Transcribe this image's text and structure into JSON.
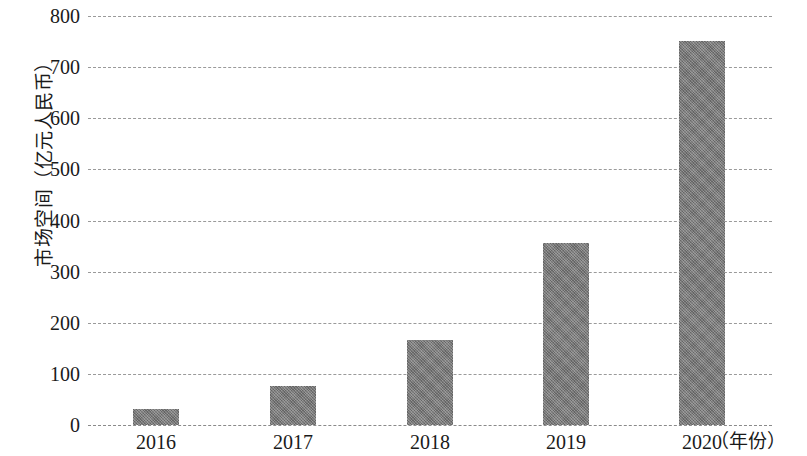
{
  "chart_data": {
    "type": "bar",
    "title": "",
    "subtitle": "",
    "xlabel": "（年份）",
    "ylabel": "市场空间（亿元人民币）",
    "categories": [
      "2016",
      "2017",
      "2018",
      "2019",
      "2020"
    ],
    "values": [
      32,
      77,
      167,
      356,
      751
    ],
    "series": [
      {
        "name": "市场空间",
        "values": [
          32,
          77,
          167,
          356,
          751
        ]
      }
    ],
    "ylim": [
      0,
      800
    ],
    "y_ticks": [
      0,
      100,
      200,
      300,
      400,
      500,
      600,
      700,
      800
    ],
    "y_tick_labels": [
      "0",
      "100",
      "200",
      "300",
      "400",
      "500",
      "600",
      "700",
      "800"
    ],
    "x_tick_labels": [
      "2016",
      "2017",
      "2018",
      "2019",
      "2020"
    ],
    "grid": true,
    "grid_style": "dashed",
    "grid_axis": "y",
    "legend": false,
    "legend_position": "none",
    "annotations": [],
    "bar_color": "#777777",
    "grid_color": "#9a9a9a",
    "text_color": "#1a1a1a",
    "background_color": "#ffffff"
  }
}
